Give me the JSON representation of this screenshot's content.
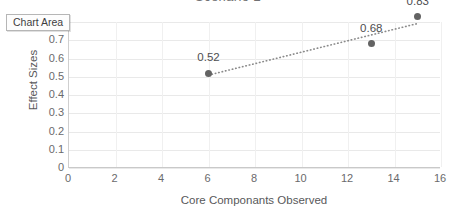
{
  "chart_area_chip": {
    "label": "Chart Area"
  },
  "chart_data": {
    "type": "scatter",
    "title": "Scenario 2",
    "xlabel": "Core Componants Observed",
    "ylabel": "Effect Sizes",
    "xlim": [
      0,
      16
    ],
    "ylim": [
      0,
      0.8
    ],
    "xticks": [
      "0",
      "2",
      "4",
      "6",
      "8",
      "10",
      "12",
      "14",
      "16"
    ],
    "yticks": [
      "0",
      "0.1",
      "0.2",
      "0.3",
      "0.4",
      "0.5",
      "0.6",
      "0.7",
      "0.8"
    ],
    "grid": "horizontal-and-vertical",
    "legend": "none",
    "marker_color": "#636363",
    "trendline": {
      "style": "dotted",
      "color": "#8a8a8a"
    },
    "points": [
      {
        "x": 6,
        "y": 0.52,
        "label": "0.52"
      },
      {
        "x": 13,
        "y": 0.68,
        "label": "0.68"
      },
      {
        "x": 15,
        "y": 0.83,
        "label": "0.83"
      }
    ]
  }
}
